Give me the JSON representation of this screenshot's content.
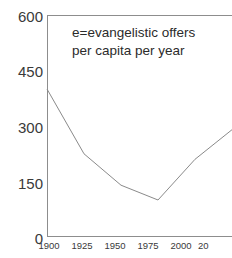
{
  "chart_data": {
    "type": "line",
    "title": "",
    "subtitle": "",
    "xlabel": "",
    "ylabel": "",
    "xlim": [
      1900,
      2025
    ],
    "ylim": [
      0,
      600
    ],
    "grid": false,
    "legend": "none",
    "annotations": [
      {
        "id": "series-key",
        "line1": "e=evangelistic offers",
        "line2": "per capita per year"
      }
    ],
    "x_tick_labels": [
      "1900",
      "1925",
      "1950",
      "1975",
      "2000",
      "20"
    ],
    "x_tick_values": [
      1900,
      1925,
      1950,
      1975,
      2000,
      2025
    ],
    "y_tick_labels": [
      "600",
      "450",
      "300",
      "150",
      "0"
    ],
    "y_tick_values": [
      600,
      450,
      300,
      150,
      0
    ],
    "x": [
      1900,
      1925,
      1950,
      1975,
      2000,
      2025
    ],
    "values": [
      400,
      225,
      140,
      100,
      210,
      290
    ],
    "series": [
      {
        "name": "e=evangelistic offers per capita per year",
        "x": [
          1900,
          1925,
          1950,
          1975,
          2000,
          2025
        ],
        "values": [
          400,
          225,
          140,
          100,
          210,
          290
        ]
      }
    ],
    "line_color": "#8a8a8a",
    "axis_color": "#8d8d8d",
    "text_color": "#3a3a3a",
    "background_color": "#ffffff"
  },
  "axes": {
    "y": {
      "ticks": [
        {
          "label": "600",
          "value": 600
        },
        {
          "label": "450",
          "value": 450
        },
        {
          "label": "300",
          "value": 300
        },
        {
          "label": "150",
          "value": 150
        },
        {
          "label": "0",
          "value": 0
        }
      ]
    },
    "x": {
      "ticks": [
        {
          "label": "1900",
          "value": 1900
        },
        {
          "label": "1925",
          "value": 1925
        },
        {
          "label": "1950",
          "value": 1950
        },
        {
          "label": "1975",
          "value": 1975
        },
        {
          "label": "2000",
          "value": 2000
        },
        {
          "label": "20",
          "value": 2025
        }
      ]
    }
  },
  "annotation": {
    "line1": "e=evangelistic offers",
    "line2": "per capita per year"
  }
}
